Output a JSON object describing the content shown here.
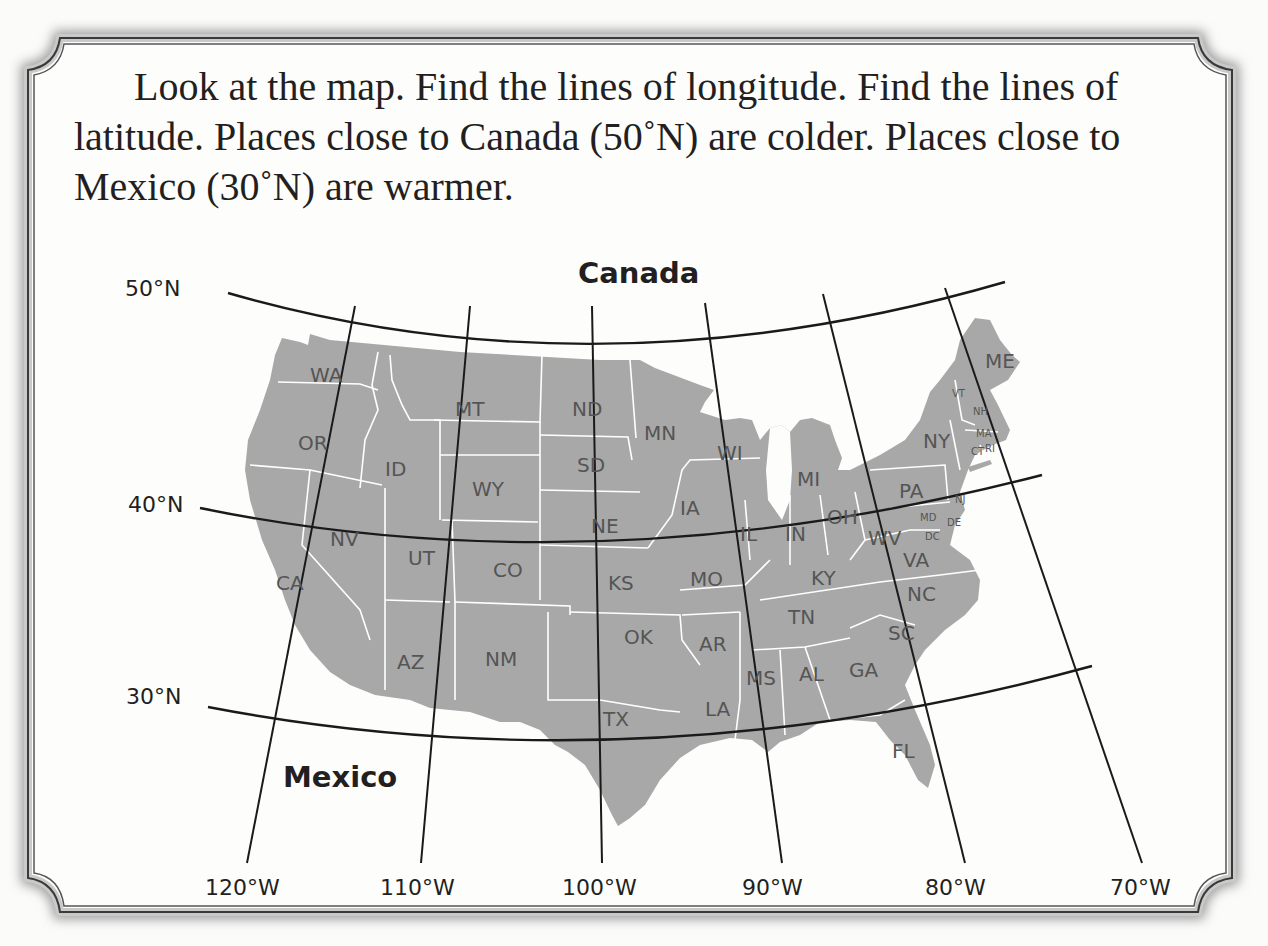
{
  "instructions": {
    "line1": "Look at the map.  Find the lines of longitude.  Find the lines of",
    "line2": "latitude.  Places close to Canada (50˚N) are colder.  Places close to",
    "line3": "Mexico (30˚N) are warmer."
  },
  "map": {
    "regions": {
      "north": "Canada",
      "south": "Mexico"
    },
    "latitudes": [
      {
        "label": "50°N",
        "value": 50
      },
      {
        "label": "40°N",
        "value": 40
      },
      {
        "label": "30°N",
        "value": 30
      }
    ],
    "longitudes": [
      {
        "label": "120°W",
        "value": -120
      },
      {
        "label": "110°W",
        "value": -110
      },
      {
        "label": "100°W",
        "value": -100
      },
      {
        "label": "90°W",
        "value": -90
      },
      {
        "label": "80°W",
        "value": -80
      },
      {
        "label": "70°W",
        "value": -70
      }
    ],
    "states": {
      "WA": "WA",
      "OR": "OR",
      "CA": "CA",
      "ID": "ID",
      "NV": "NV",
      "MT": "MT",
      "WY": "WY",
      "UT": "UT",
      "AZ": "AZ",
      "CO": "CO",
      "NM": "NM",
      "ND": "ND",
      "SD": "SD",
      "NE": "NE",
      "KS": "KS",
      "OK": "OK",
      "TX": "TX",
      "MN": "MN",
      "IA": "IA",
      "MO": "MO",
      "AR": "AR",
      "LA": "LA",
      "WI": "WI",
      "IL": "IL",
      "MI": "MI",
      "IN": "IN",
      "OH": "OH",
      "KY": "KY",
      "TN": "TN",
      "MS": "MS",
      "AL": "AL",
      "GA": "GA",
      "FL": "FL",
      "SC": "SC",
      "NC": "NC",
      "VA": "VA",
      "WV": "WV",
      "PA": "PA",
      "NY": "NY",
      "MD": "MD",
      "DE": "DE",
      "DC": "DC",
      "NJ": "NJ",
      "VT": "VT",
      "NH": "NH",
      "MA": "MA",
      "CT": "CT",
      "RI": "RI",
      "ME": "ME"
    },
    "colors": {
      "land": "#a8a8a8",
      "borders": "#ffffff",
      "grid": "#1a1a1a",
      "label": "#555555"
    }
  }
}
